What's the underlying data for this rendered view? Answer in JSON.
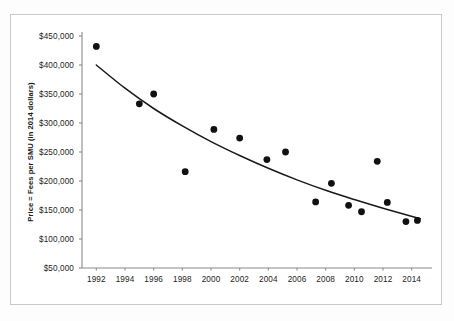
{
  "figure": {
    "background_color": "#ffffff",
    "frame_color": "#c9c9c7",
    "axis_color": "#8a8a88",
    "marker_color": "#111111",
    "trendline_color": "#1a1a1a"
  },
  "chart_data": {
    "type": "scatter",
    "title": "",
    "subtitle": "",
    "xlabel": "",
    "ylabel": "Price = Fees per SMU (in 2014 dollars)",
    "xlim": [
      1991,
      2015
    ],
    "ylim": [
      50000,
      450000
    ],
    "grid": false,
    "legend": "none",
    "x_tick_labels": [
      "1992",
      "1994",
      "1996",
      "1998",
      "2000",
      "2002",
      "2004",
      "2006",
      "2008",
      "2010",
      "2012",
      "2014"
    ],
    "x_tick_values": [
      1992,
      1994,
      1996,
      1998,
      2000,
      2002,
      2004,
      2006,
      2008,
      2010,
      2012,
      2014
    ],
    "y_tick_labels": [
      "$450,000",
      "$400,000",
      "$350,000",
      "$300,000",
      "$250,000",
      "$200,000",
      "$150,000",
      "$100,000",
      "$50,000"
    ],
    "y_tick_values": [
      450000,
      400000,
      350000,
      300000,
      250000,
      200000,
      150000,
      100000,
      50000
    ],
    "points": [
      {
        "x": 1992.0,
        "y": 432000
      },
      {
        "x": 1995.0,
        "y": 333000
      },
      {
        "x": 1996.0,
        "y": 350000
      },
      {
        "x": 1998.2,
        "y": 216000
      },
      {
        "x": 2000.2,
        "y": 289000
      },
      {
        "x": 2002.0,
        "y": 274000
      },
      {
        "x": 2003.9,
        "y": 237000
      },
      {
        "x": 2005.2,
        "y": 250000
      },
      {
        "x": 2007.3,
        "y": 164000
      },
      {
        "x": 2008.4,
        "y": 196000
      },
      {
        "x": 2009.6,
        "y": 158000
      },
      {
        "x": 2010.5,
        "y": 147000
      },
      {
        "x": 2011.6,
        "y": 234000
      },
      {
        "x": 2012.3,
        "y": 163000
      },
      {
        "x": 2013.6,
        "y": 130000
      },
      {
        "x": 2014.4,
        "y": 132000
      }
    ],
    "trendline": {
      "label": "fitted exponential decay curve",
      "x_start": 1992,
      "x_end": 2014.6,
      "y_start": 400000,
      "y_end": 135000,
      "points": [
        {
          "x": 1992.0,
          "y": 400000
        },
        {
          "x": 1994.0,
          "y": 360000
        },
        {
          "x": 1996.0,
          "y": 325000
        },
        {
          "x": 1998.0,
          "y": 295000
        },
        {
          "x": 2000.0,
          "y": 268000
        },
        {
          "x": 2002.0,
          "y": 244000
        },
        {
          "x": 2004.0,
          "y": 222000
        },
        {
          "x": 2006.0,
          "y": 202000
        },
        {
          "x": 2008.0,
          "y": 184000
        },
        {
          "x": 2010.0,
          "y": 168000
        },
        {
          "x": 2012.0,
          "y": 153000
        },
        {
          "x": 2014.6,
          "y": 135000
        }
      ]
    }
  }
}
